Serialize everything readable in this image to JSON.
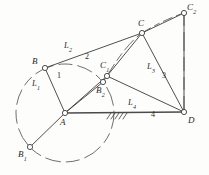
{
  "figure": {
    "type": "kinematic-linkage-diagram",
    "stroke_color": "#3b3b3b",
    "joint_fill": "#ffffff",
    "ground_line_color": "#555555",
    "background": "#fdfdfb"
  },
  "points": [
    {
      "id": "A",
      "label": "A",
      "sub": "",
      "x": 65,
      "y": 113,
      "label_x": 60,
      "label_y": 118
    },
    {
      "id": "B",
      "label": "B",
      "sub": "",
      "x": 45,
      "y": 68,
      "label_x": 32,
      "label_y": 57
    },
    {
      "id": "B1",
      "label": "B",
      "sub": "1",
      "x": 30,
      "y": 147,
      "label_x": 18,
      "label_y": 150
    },
    {
      "id": "B2",
      "label": "B",
      "sub": "2",
      "x": 103,
      "y": 82,
      "label_x": 96,
      "label_y": 86
    },
    {
      "id": "C",
      "label": "C",
      "sub": "",
      "x": 142,
      "y": 33,
      "label_x": 138,
      "label_y": 19
    },
    {
      "id": "C1",
      "label": "C",
      "sub": "1",
      "x": 107,
      "y": 76,
      "label_x": 100,
      "label_y": 61
    },
    {
      "id": "C2",
      "label": "C",
      "sub": "2",
      "x": 184,
      "y": 13,
      "label_x": 187,
      "label_y": 4
    },
    {
      "id": "D",
      "label": "D",
      "sub": "",
      "x": 184,
      "y": 112,
      "label_x": 188,
      "label_y": 116
    }
  ],
  "link_labels": [
    {
      "id": "L1",
      "text": "L",
      "sub": "1",
      "x": 38,
      "y": 79
    },
    {
      "id": "L2",
      "text": "L",
      "sub": "2",
      "x": 68,
      "y": 45
    },
    {
      "id": "L3",
      "text": "L",
      "sub": "3",
      "x": 150,
      "y": 66
    },
    {
      "id": "L4",
      "text": "L",
      "sub": "4",
      "x": 131,
      "y": 101
    }
  ],
  "number_labels": [
    {
      "id": "n1",
      "text": "1",
      "x": 58,
      "y": 76
    },
    {
      "id": "n2",
      "text": "2",
      "x": 86,
      "y": 57
    },
    {
      "id": "n3",
      "text": "3",
      "x": 163,
      "y": 76
    },
    {
      "id": "n4",
      "text": "4",
      "x": 152,
      "y": 114
    }
  ],
  "solid_links": [
    {
      "id": "A-B",
      "from": "A",
      "to": "B"
    },
    {
      "id": "B-C",
      "from": "B",
      "to": "C"
    },
    {
      "id": "A-B1",
      "from": "A",
      "to": "B1"
    },
    {
      "id": "A-B2",
      "from": "A",
      "to": "B2"
    },
    {
      "id": "A-C1",
      "from": "A",
      "to": "C1"
    },
    {
      "id": "B2-C1",
      "from": "B2",
      "to": "C1"
    },
    {
      "id": "C1-C",
      "from": "C1",
      "to": "C"
    },
    {
      "id": "C1-D",
      "from": "C1",
      "to": "D"
    },
    {
      "id": "C-D",
      "from": "C",
      "to": "D"
    },
    {
      "id": "C-C2",
      "from": "C",
      "to": "C2"
    },
    {
      "id": "C2-D",
      "from": "C2",
      "to": "D"
    },
    {
      "id": "A-D",
      "from": "A",
      "to": "D"
    }
  ],
  "dashed_elements": [
    {
      "id": "circle-A",
      "kind": "circle",
      "center": "A",
      "radius": 49
    },
    {
      "id": "arc-C1-C",
      "kind": "arc",
      "from": "C1",
      "to": "C"
    },
    {
      "id": "arc-C-C2",
      "kind": "arc",
      "from": "C",
      "to": "C2"
    },
    {
      "id": "line-C2-D",
      "kind": "line",
      "from": "C2",
      "to": "D"
    }
  ],
  "ground": {
    "id": "ground-hatch",
    "line_from": "A",
    "line_to": "D",
    "hatch_start_x": 106,
    "hatch_end_x": 124,
    "hatch_y": 113,
    "hatch_count": 5
  }
}
